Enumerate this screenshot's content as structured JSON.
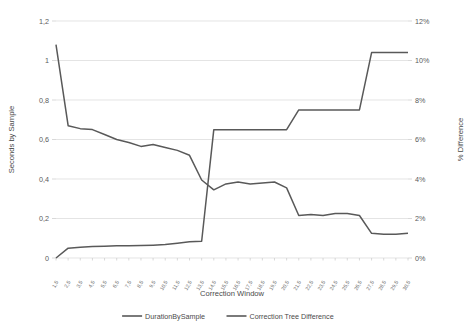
{
  "chart_data": {
    "type": "line",
    "title": "",
    "xlabel": "Correction Window",
    "ylabel": "Seconds by Sample",
    "y2label": "% Difference",
    "grid": true,
    "legend_position": "bottom",
    "ylim": [
      0,
      1.2
    ],
    "y2lim": [
      0,
      12
    ],
    "yticks": [
      "0",
      "0,2",
      "0,4",
      "0,6",
      "0,8",
      "1",
      "1,2"
    ],
    "ytick_values": [
      0,
      0.2,
      0.4,
      0.6,
      0.8,
      1.0,
      1.2
    ],
    "y2ticks": [
      "0%",
      "2%",
      "4%",
      "6%",
      "8%",
      "10%",
      "12%"
    ],
    "y2tick_values": [
      0,
      2,
      4,
      6,
      8,
      10,
      12
    ],
    "categories": [
      "1,5",
      "2,5",
      "3,5",
      "4,5",
      "5,5",
      "6,5",
      "7,5",
      "8,5",
      "9,5",
      "10,5",
      "11,5",
      "12,5",
      "13,5",
      "14,5",
      "15,5",
      "16,5",
      "17,5",
      "18,5",
      "19,5",
      "20,5",
      "21,5",
      "22,5",
      "23,5",
      "24,5",
      "25,5",
      "26,5",
      "27,5",
      "28,5",
      "29,5",
      "30,5"
    ],
    "series": [
      {
        "name": "DurationBySample",
        "axis": "left",
        "color": "#595959",
        "values": [
          1.08,
          0.67,
          0.655,
          0.65,
          0.625,
          0.6,
          0.585,
          0.565,
          0.575,
          0.56,
          0.545,
          0.52,
          0.395,
          0.345,
          0.375,
          0.385,
          0.375,
          0.38,
          0.385,
          0.355,
          0.215,
          0.22,
          0.215,
          0.225,
          0.225,
          0.215,
          0.125,
          0.12,
          0.12,
          0.125
        ]
      },
      {
        "name": "Correction Tree Difference",
        "axis": "right",
        "color": "#595959",
        "values": [
          0.0,
          0.5,
          0.55,
          0.58,
          0.6,
          0.62,
          0.62,
          0.63,
          0.65,
          0.68,
          0.75,
          0.82,
          0.85,
          6.5,
          6.5,
          6.5,
          6.5,
          6.5,
          6.5,
          6.5,
          7.5,
          7.5,
          7.5,
          7.5,
          7.5,
          7.5,
          10.4,
          10.4,
          10.4,
          10.4
        ]
      }
    ],
    "legend": [
      {
        "label": "DurationBySample",
        "color": "#595959"
      },
      {
        "label": "Correction Tree Difference",
        "color": "#595959"
      }
    ]
  }
}
